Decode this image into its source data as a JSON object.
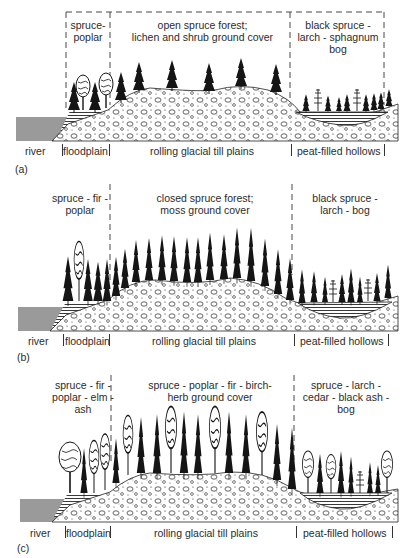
{
  "figure": {
    "panels": [
      {
        "id": "(a)",
        "zones": {
          "floodplain_veg": [
            "spruce-",
            "poplar"
          ],
          "upland_veg": [
            "open spruce forest;",
            "lichen and shrub ground cover"
          ],
          "bog_veg": [
            "black spruce -",
            "larch - sphagnum",
            "bog"
          ]
        },
        "landforms": {
          "river": "river",
          "floodplain": "floodplain",
          "till": "rolling glacial till plains",
          "hollows": "peat-filled hollows"
        },
        "boundary_style": "dashed box"
      },
      {
        "id": "(b)",
        "zones": {
          "floodplain_veg": [
            "spruce - fir -",
            "poplar"
          ],
          "upland_veg": [
            "closed spruce forest;",
            "moss ground cover"
          ],
          "bog_veg": [
            "black spruce -",
            "larch - bog"
          ]
        },
        "landforms": {
          "river": "river",
          "floodplain": "floodplain",
          "till": "rolling glacial till plains",
          "hollows": "peat-filled hollows"
        },
        "boundary_style": "dashed lines"
      },
      {
        "id": "(c)",
        "zones": {
          "floodplain_veg": [
            "spruce - fir -",
            "poplar - elm -",
            "ash"
          ],
          "upland_veg": [
            "spruce - poplar - fir - birch-",
            "herb ground cover"
          ],
          "bog_veg": [
            "spruce - larch -",
            "cedar - black ash -",
            "bog"
          ]
        },
        "landforms": {
          "river": "river",
          "floodplain": "floodplain",
          "till": "rolling glacial till plains",
          "hollows": "peat-filled hollows"
        },
        "boundary_style": "dashed lines"
      }
    ],
    "colors": {
      "river": "#9a9a9a",
      "ink": "#1a1a1a",
      "background": "#ffffff"
    }
  }
}
